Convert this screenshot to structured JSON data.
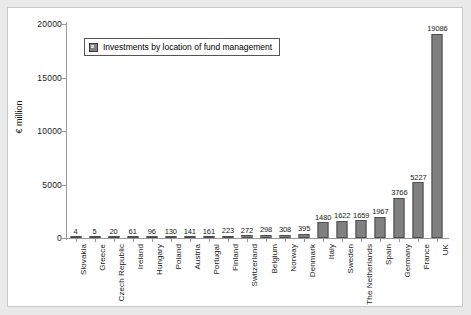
{
  "chart_data": {
    "type": "bar",
    "title": "",
    "xlabel": "",
    "ylabel": "€ million",
    "ylim": [
      0,
      20000
    ],
    "yticks": [
      0,
      5000,
      10000,
      15000,
      20000
    ],
    "ytick_labels": [
      "0",
      "5000",
      "10000",
      "15000",
      "20000"
    ],
    "grid": false,
    "legend_position": "upper left",
    "legend": [
      "Investments by location of fund management"
    ],
    "categories": [
      "Slovakia",
      "Greece",
      "Czech Republic",
      "Ireland",
      "Hungary",
      "Poland",
      "Austria",
      "Portugal",
      "Finland",
      "Switzerland",
      "Belgium",
      "Norway",
      "Denmark",
      "Italy",
      "Sweden",
      "The Netherlands",
      "Spain",
      "Germany",
      "France",
      "UK"
    ],
    "values": [
      4,
      5,
      20,
      61,
      96,
      130,
      141,
      161,
      223,
      272,
      298,
      308,
      395,
      1480,
      1622,
      1659,
      1967,
      3766,
      5227,
      19086
    ],
    "value_labels": [
      "4",
      "5",
      "20",
      "61",
      "96",
      "130",
      "141",
      "161",
      "223",
      "272",
      "298",
      "308",
      "395",
      "1480",
      "1622",
      "1659",
      "1967",
      "3766",
      "5227",
      "19086"
    ],
    "series": [
      {
        "name": "Investments by location of fund management",
        "values": [
          4,
          5,
          20,
          61,
          96,
          130,
          141,
          161,
          223,
          272,
          298,
          308,
          395,
          1480,
          1622,
          1659,
          1967,
          3766,
          5227,
          19086
        ]
      }
    ],
    "colors": {
      "bar_fill": "#808080",
      "bar_edge": "#4d4d4d",
      "axis": "#9a9a9a",
      "text": "#1a1a1a",
      "frame": "#e9e9e9",
      "plot_background": "#ffffff"
    }
  }
}
